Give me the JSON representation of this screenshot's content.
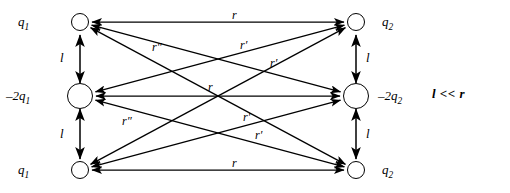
{
  "diagram": {
    "condition_note": "l << r",
    "stroke_color": "#000000",
    "background_color": "#ffffff"
  },
  "left_group": {
    "charges": [
      {
        "id": "left-top",
        "label": "q1",
        "label_text": "q",
        "sub": "1",
        "sign": "+",
        "radius": 9,
        "cx": 80,
        "cy": 22
      },
      {
        "id": "left-middle",
        "label": "-2q1",
        "label_text": "–2q",
        "sub": "1",
        "sign": "-",
        "radius": 13,
        "cx": 80,
        "cy": 96
      },
      {
        "id": "left-bottom",
        "label": "q1",
        "label_text": "q",
        "sub": "1",
        "sign": "+",
        "radius": 9,
        "cx": 80,
        "cy": 170
      }
    ],
    "gap_labels": [
      {
        "id": "left-gap-upper",
        "text": "l"
      },
      {
        "id": "left-gap-lower",
        "text": "l"
      }
    ]
  },
  "right_group": {
    "charges": [
      {
        "id": "right-top",
        "label": "q2",
        "label_text": "q",
        "sub": "2",
        "sign": "+",
        "radius": 9,
        "cx": 356,
        "cy": 22
      },
      {
        "id": "right-middle",
        "label": "-2q2",
        "label_text": "–2q",
        "sub": "2",
        "sign": "-",
        "radius": 13,
        "cx": 356,
        "cy": 96
      },
      {
        "id": "right-bottom",
        "label": "q2",
        "label_text": "q",
        "sub": "2",
        "sign": "+",
        "radius": 9,
        "cx": 356,
        "cy": 170
      }
    ],
    "gap_labels": [
      {
        "id": "right-gap-upper",
        "text": "l"
      },
      {
        "id": "right-gap-lower",
        "text": "l"
      }
    ]
  },
  "charge_text": {
    "q1": "q",
    "q1_sub": "1",
    "q2": "q",
    "q2_sub": "2",
    "neg2q1": "–2q",
    "neg2q1_sub": "1",
    "neg2q2": "–2q",
    "neg2q2_sub": "2",
    "l": "l"
  },
  "distance_labels": {
    "r": "r",
    "r_prime": "r′",
    "r_double_prime": "r″"
  },
  "connections": [
    {
      "id": "top-top",
      "from": "left-top",
      "to": "right-top",
      "label": "r",
      "label_x": 232,
      "label_y": 8
    },
    {
      "id": "middle-middle",
      "from": "left-middle",
      "to": "right-middle",
      "label": "r",
      "label_x": 208,
      "label_y": 80
    },
    {
      "id": "bottom-bottom",
      "from": "left-bottom",
      "to": "right-bottom",
      "label": "r",
      "label_x": 232,
      "label_y": 156
    },
    {
      "id": "top-middle",
      "from": "left-top",
      "to": "right-middle",
      "label": "r′",
      "label_x": 270,
      "label_y": 56
    },
    {
      "id": "middle-top",
      "from": "left-middle",
      "to": "right-top",
      "label": "r′",
      "label_x": 240,
      "label_y": 38
    },
    {
      "id": "middle-bottom",
      "from": "left-middle",
      "to": "right-bottom",
      "label": "r′",
      "label_x": 255,
      "label_y": 128
    },
    {
      "id": "bottom-middle",
      "from": "left-bottom",
      "to": "right-middle",
      "label": "r′",
      "label_x": 243,
      "label_y": 110
    },
    {
      "id": "top-bottom",
      "from": "left-top",
      "to": "right-bottom",
      "label": "r″",
      "label_x": 152,
      "label_y": 40
    },
    {
      "id": "bottom-top",
      "from": "left-bottom",
      "to": "right-top",
      "label": "r″",
      "label_x": 122,
      "label_y": 114
    }
  ],
  "vertical_gaps": [
    {
      "id": "left-gap-upper",
      "x": 80,
      "y1": 35,
      "y2": 83,
      "label_x": 60,
      "label_y": 50
    },
    {
      "id": "left-gap-lower",
      "x": 80,
      "y1": 109,
      "y2": 159,
      "label_x": 60,
      "label_y": 126
    },
    {
      "id": "right-gap-upper",
      "x": 356,
      "y1": 35,
      "y2": 83,
      "label_x": 366,
      "label_y": 50
    },
    {
      "id": "right-gap-lower",
      "x": 356,
      "y1": 109,
      "y2": 159,
      "label_x": 366,
      "label_y": 126
    }
  ]
}
